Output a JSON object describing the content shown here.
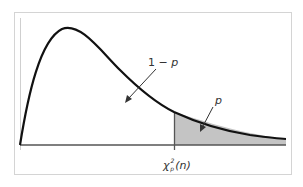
{
  "diagram": {
    "labels": {
      "left_area": "1 − p",
      "left_area_prefix": "1 − ",
      "left_area_var": "p",
      "right_area": "p",
      "critical_value_symbol": "χ",
      "critical_value_superscript": "2",
      "critical_value_subscript": "p",
      "critical_value_arg": "(n)"
    },
    "colors": {
      "curve": "#111111",
      "shaded_region": "#c4c4c4",
      "axis": "#555555",
      "frame": "#d4d4d4"
    }
  }
}
